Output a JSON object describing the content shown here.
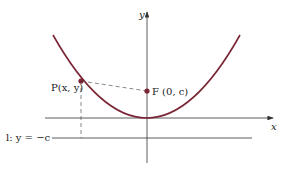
{
  "diagram": {
    "type": "parabola-focus-directrix",
    "axes": {
      "x_label": "x",
      "y_label": "y"
    },
    "point_label": "P(x, y)",
    "focus_label": "F (0, c)",
    "directrix_label": "l: y = −c",
    "colors": {
      "curve": "#7a2535",
      "point": "#7a2535",
      "axis": "#333333",
      "dashed": "#555555"
    }
  }
}
